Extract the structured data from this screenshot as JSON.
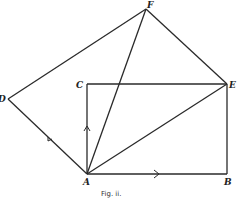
{
  "figure": {
    "caption": "Fig. ii.",
    "points": {
      "A": {
        "label": "A",
        "x": 87,
        "y": 174
      },
      "B": {
        "label": "B",
        "x": 227,
        "y": 174
      },
      "C": {
        "label": "C",
        "x": 87,
        "y": 84
      },
      "E": {
        "label": "E",
        "x": 227,
        "y": 84
      },
      "D": {
        "label": "D",
        "x": 8,
        "y": 99
      },
      "F": {
        "label": "F",
        "x": 146,
        "y": 9
      }
    },
    "segments": [
      [
        "A",
        "B"
      ],
      [
        "B",
        "E"
      ],
      [
        "E",
        "C"
      ],
      [
        "C",
        "A"
      ],
      [
        "A",
        "D"
      ],
      [
        "D",
        "F"
      ],
      [
        "F",
        "E"
      ],
      [
        "A",
        "E"
      ],
      [
        "A",
        "F"
      ]
    ],
    "arrows": [
      {
        "on": "AB",
        "direction": "toward B"
      },
      {
        "on": "AC",
        "direction": "toward C"
      },
      {
        "on": "AD",
        "direction": "toward D"
      }
    ]
  }
}
